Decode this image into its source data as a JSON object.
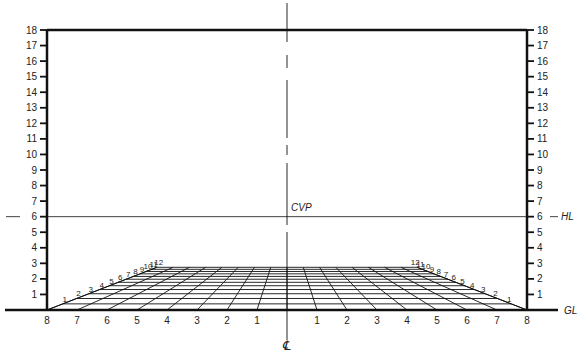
{
  "diagram": {
    "labels": {
      "cvp": "CVP",
      "hl": "HL",
      "gl": "GL",
      "centerline": "℄"
    },
    "left_scale": [
      "1",
      "2",
      "3",
      "4",
      "5",
      "6",
      "7",
      "8",
      "9",
      "10",
      "11",
      "12",
      "13",
      "14",
      "15",
      "16",
      "17",
      "18"
    ],
    "right_scale": [
      "1",
      "2",
      "3",
      "4",
      "5",
      "6",
      "7",
      "8",
      "9",
      "10",
      "11",
      "12",
      "13",
      "14",
      "15",
      "16",
      "17",
      "18"
    ],
    "ground_left_numbers": [
      "8",
      "7",
      "6",
      "5",
      "4",
      "3",
      "2",
      "1"
    ],
    "ground_right_numbers": [
      "1",
      "2",
      "3",
      "4",
      "5",
      "6",
      "7",
      "8"
    ],
    "depth_numbers": [
      "1",
      "2",
      "3",
      "4",
      "5",
      "6",
      "7",
      "8",
      "9",
      "10",
      "11",
      "12"
    ],
    "horizon_height": 6,
    "grid": {
      "columns_each_side": 8,
      "depth_rows": 12
    },
    "colors": {
      "ink": "#111111",
      "background": "#ffffff"
    }
  }
}
